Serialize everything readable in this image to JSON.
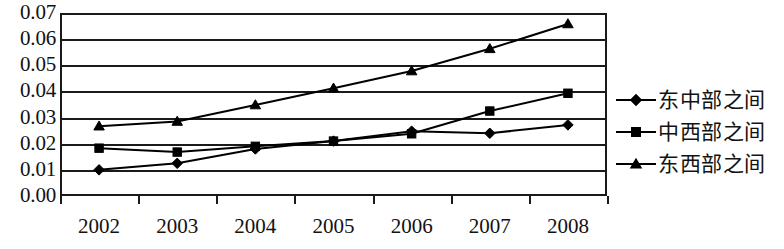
{
  "chart_data": {
    "type": "line",
    "title": "",
    "xlabel": "",
    "ylabel": "",
    "categories": [
      "2002",
      "2003",
      "2004",
      "2005",
      "2006",
      "2007",
      "2008"
    ],
    "ylim": [
      0.0,
      0.07
    ],
    "ytick_labels": [
      "0.07",
      "0.06",
      "0.05",
      "0.04",
      "0.03",
      "0.02",
      "0.01",
      "0.00"
    ],
    "ytick_values": [
      0.07,
      0.06,
      0.05,
      0.04,
      0.03,
      0.02,
      0.01,
      0.0
    ],
    "grid": true,
    "legend_position": "right",
    "series": [
      {
        "name": "东中部之间",
        "marker": "diamond",
        "color": "#000000",
        "values": [
          0.01,
          0.0125,
          0.018,
          0.021,
          0.0248,
          0.024,
          0.0272
        ]
      },
      {
        "name": "中西部之间",
        "marker": "square",
        "color": "#000000",
        "values": [
          0.0183,
          0.0168,
          0.019,
          0.021,
          0.0238,
          0.0325,
          0.0393
        ]
      },
      {
        "name": "东西部之间",
        "marker": "triangle",
        "color": "#000000",
        "values": [
          0.0267,
          0.0285,
          0.0348,
          0.0412,
          0.0478,
          0.0563,
          0.0658
        ]
      }
    ]
  },
  "legend": {
    "items": [
      {
        "label": "东中部之间",
        "marker": "diamond-marker-icon"
      },
      {
        "label": "中西部之间",
        "marker": "square-marker-icon"
      },
      {
        "label": "东西部之间",
        "marker": "triangle-marker-icon"
      }
    ]
  }
}
